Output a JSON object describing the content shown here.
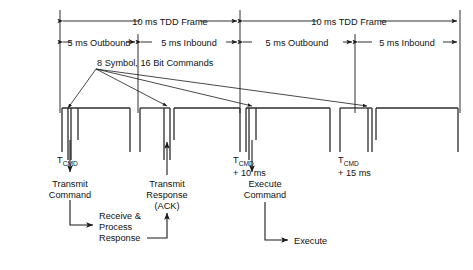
{
  "diagram": {
    "frames": [
      {
        "label": "10 ms TDD Frame"
      },
      {
        "label": "10 ms TDD Frame"
      }
    ],
    "halves": [
      {
        "label": "5 ms Outbound"
      },
      {
        "label": "5 ms Inbound"
      },
      {
        "label": "5 ms Outbound"
      },
      {
        "label": "5 ms Inbound"
      }
    ],
    "callout": {
      "label": "8 Symbol, 16 Bit Commands"
    },
    "time_markers": [
      {
        "base": "T",
        "sub": "CMD",
        "offset": ""
      },
      {
        "base": "T",
        "sub": "CMD",
        "offset": "+ 10 ms"
      },
      {
        "base": "T",
        "sub": "CMD",
        "offset": "+ 15 ms"
      }
    ],
    "events": [
      {
        "line1": "Transmit",
        "line2": "Command",
        "line3": ""
      },
      {
        "line1": "Transmit",
        "line2": "Response",
        "line3": "(ACK)"
      },
      {
        "line1": "Execute",
        "line2": "Command",
        "line3": ""
      }
    ],
    "process_blocks": [
      {
        "line1": "Receive &",
        "line2": "Process",
        "line3": "Response"
      }
    ],
    "outputs": [
      {
        "label": "Execute"
      }
    ],
    "colors": {
      "ink": "#1a1a1a",
      "wave": "#2b2b2b",
      "background": "#ffffff"
    }
  }
}
